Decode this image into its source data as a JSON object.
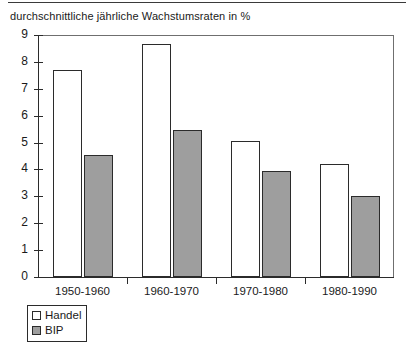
{
  "chart_data": {
    "type": "bar",
    "title": "durchschnittliche jährliche Wachstumsraten in %",
    "xlabel": "",
    "ylabel": "",
    "ylim": [
      0,
      9
    ],
    "yticks": [
      0,
      1,
      2,
      3,
      4,
      5,
      6,
      7,
      8,
      9
    ],
    "ytick_labels": [
      "0",
      "1",
      "2",
      "3",
      "4",
      "5",
      "6",
      "7",
      "8",
      "9"
    ],
    "grid": false,
    "legend_position": "bottom-left",
    "categories": [
      "1950-1960",
      "1960-1970",
      "1970-1980",
      "1980-1990"
    ],
    "series": [
      {
        "name": "Handel",
        "color": "#ffffff",
        "edge_color": "#2b2b2b",
        "values": [
          7.7,
          8.65,
          5.05,
          4.2
        ]
      },
      {
        "name": "BIP",
        "color": "#9e9e9e",
        "edge_color": "#2b2b2b",
        "values": [
          4.55,
          5.45,
          3.95,
          3.0
        ]
      }
    ]
  },
  "legend": {
    "items": [
      {
        "label": "Handel",
        "swatch": "white-square-swatch"
      },
      {
        "label": "BIP",
        "swatch": "gray-square-swatch"
      }
    ]
  }
}
